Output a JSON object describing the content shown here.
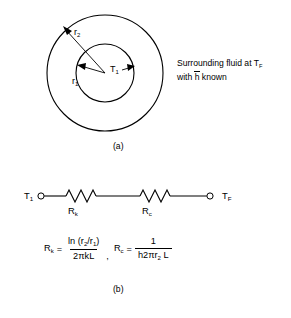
{
  "figure": {
    "part_a": {
      "caption": "(a)",
      "labels": {
        "r_outer": "r",
        "r_outer_sub": "2",
        "r_inner": "r",
        "r_inner_sub": "1",
        "temp_inner": "T",
        "temp_inner_sub": "1"
      },
      "note_line1_pre": "Surrounding fluid at T",
      "note_line1_sub": "F",
      "note_line2_pre": "with ",
      "note_line2_bar": "h",
      "note_line2_post": " known",
      "shapes": {
        "outer_circle_label": "outer-circle",
        "inner_circle_label": "inner-circle"
      }
    },
    "part_b": {
      "caption": "(b)",
      "network": {
        "left_node": "T",
        "left_node_sub": "1",
        "right_node": "T",
        "right_node_sub": "F",
        "resistor1": "R",
        "resistor1_sub": "k",
        "resistor2": "R",
        "resistor2_sub": "c"
      },
      "equations": {
        "eq1_lhs": "R",
        "eq1_lhs_sub": "k",
        "equals": "=",
        "eq1_numerator_pre": "ln (r",
        "eq1_numerator_sub1": "2",
        "eq1_numerator_mid": "/r",
        "eq1_numerator_sub2": "1",
        "eq1_numerator_post": ")",
        "eq1_denominator": "2πkL",
        "separator": ",",
        "eq2_lhs": "R",
        "eq2_lhs_sub": "c",
        "eq2_numerator": "1",
        "eq2_den_h": "h",
        "eq2_den_mid": "2πr",
        "eq2_den_sub": "2",
        "eq2_den_post": " L"
      }
    }
  },
  "colors": {
    "stroke": "#000000",
    "background": "#ffffff"
  }
}
